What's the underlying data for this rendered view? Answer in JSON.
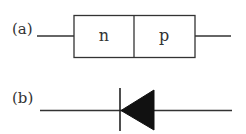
{
  "figure": {
    "part_a": {
      "label": "(a)",
      "description": "p-n junction block",
      "regions": [
        {
          "label": "n"
        },
        {
          "label": "p"
        }
      ]
    },
    "part_b": {
      "label": "(b)",
      "description": "diode symbol, triangle pointing left toward bar"
    },
    "colors": {
      "stroke": "#333333",
      "fill": "#111111",
      "background": "#ffffff"
    }
  }
}
